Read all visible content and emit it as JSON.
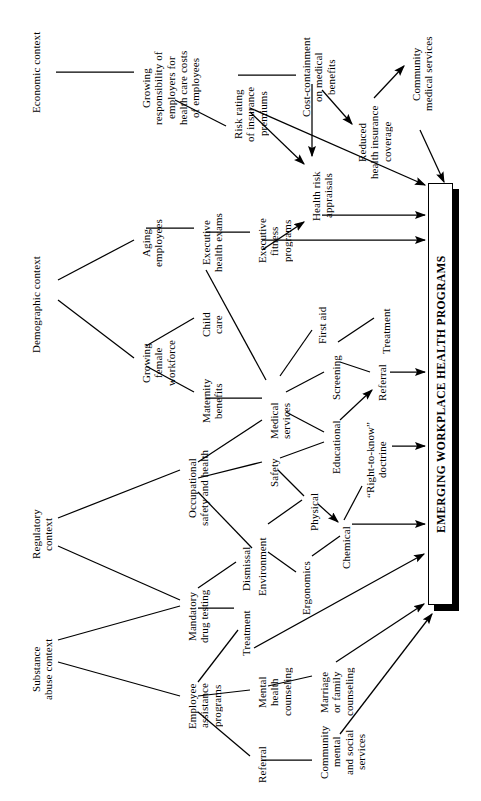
{
  "figure": {
    "type": "tree-diagram",
    "orientation": "rotated-90-ccw",
    "background": "#ffffff",
    "line_color": "#000000",
    "text_color": "#000000"
  },
  "title_box": {
    "label": "EMERGING WORKPLACE HEALTH PROGRAMS",
    "x": 428,
    "y": 183,
    "w": 25,
    "h": 422,
    "shadow_offset": 6
  },
  "nodes": [
    {
      "id": "economic-context",
      "label": "Economic context",
      "x": 30,
      "y": 18,
      "len": 108,
      "size": 11
    },
    {
      "id": "growing-responsibility",
      "label": "Growing\nresponsibility of\nemployers for\nhealth care costs\nof employees",
      "x": 140,
      "y": 36,
      "len": 104,
      "size": 11
    },
    {
      "id": "risk-rating",
      "label": "Risk rating\nof insurance\npremiums",
      "x": 232,
      "y": 78,
      "len": 72,
      "size": 11
    },
    {
      "id": "cost-containment",
      "label": "Cost-containment\non medical\nbenefits",
      "x": 300,
      "y": 26,
      "len": 102,
      "size": 11
    },
    {
      "id": "reduced-coverage",
      "label": "Reduced\nhealth insurance\ncoverage",
      "x": 356,
      "y": 94,
      "len": 96,
      "size": 11
    },
    {
      "id": "community-medical-services",
      "label": "Community\nmedical services",
      "x": 410,
      "y": 22,
      "len": 104,
      "size": 11
    },
    {
      "id": "health-risk-appraisals",
      "label": "Health risk\nappraisals",
      "x": 310,
      "y": 162,
      "len": 68,
      "size": 11
    },
    {
      "id": "demographic-context",
      "label": "Demographic context",
      "x": 30,
      "y": 242,
      "len": 126,
      "size": 11
    },
    {
      "id": "aging-employees",
      "label": "Aging\nemployees",
      "x": 140,
      "y": 210,
      "len": 66,
      "size": 11
    },
    {
      "id": "executive-health-exams",
      "label": "Executive\nhealth exams",
      "x": 200,
      "y": 202,
      "len": 82,
      "size": 11
    },
    {
      "id": "executive-fitness",
      "label": "Executive\nfitness\nprograms",
      "x": 256,
      "y": 210,
      "len": 62,
      "size": 11
    },
    {
      "id": "growing-female-workforce",
      "label": "Growing\nfemale\nworkforce",
      "x": 140,
      "y": 330,
      "len": 66,
      "size": 11
    },
    {
      "id": "child-care",
      "label": "Child\ncare",
      "x": 200,
      "y": 306,
      "len": 38,
      "size": 11
    },
    {
      "id": "maternity-benefits",
      "label": "Maternity\nbenefits",
      "x": 200,
      "y": 370,
      "len": 62,
      "size": 11
    },
    {
      "id": "medical-services",
      "label": "Medical\nservices",
      "x": 268,
      "y": 392,
      "len": 58,
      "size": 11
    },
    {
      "id": "first-aid",
      "label": "First aid",
      "x": 316,
      "y": 298,
      "len": 54,
      "size": 11
    },
    {
      "id": "screening",
      "label": "Screening",
      "x": 330,
      "y": 348,
      "len": 60,
      "size": 11
    },
    {
      "id": "treatment-med",
      "label": "Treatment",
      "x": 380,
      "y": 300,
      "len": 62,
      "size": 11
    },
    {
      "id": "referral-med",
      "label": "Referral",
      "x": 376,
      "y": 358,
      "len": 50,
      "size": 11
    },
    {
      "id": "educational",
      "label": "Educational",
      "x": 330,
      "y": 414,
      "len": 66,
      "size": 11
    },
    {
      "id": "right-to-know",
      "label": "“Right-to-know”\ndoctrine",
      "x": 364,
      "y": 414,
      "len": 92,
      "size": 11
    },
    {
      "id": "regulatory-context",
      "label": "Regulatory\ncontext",
      "x": 30,
      "y": 500,
      "len": 68,
      "size": 11
    },
    {
      "id": "occupational-safety",
      "label": "Occupational\nsafety and health",
      "x": 186,
      "y": 440,
      "len": 96,
      "size": 11
    },
    {
      "id": "safety",
      "label": "Safety",
      "x": 268,
      "y": 452,
      "len": 42,
      "size": 11
    },
    {
      "id": "physical",
      "label": "Physical",
      "x": 308,
      "y": 486,
      "len": 52,
      "size": 11
    },
    {
      "id": "chemical",
      "label": "Chemical",
      "x": 340,
      "y": 520,
      "len": 56,
      "size": 11
    },
    {
      "id": "environment",
      "label": "Environment",
      "x": 256,
      "y": 530,
      "len": 74,
      "size": 11
    },
    {
      "id": "ergonomics",
      "label": "Ergonomics",
      "x": 300,
      "y": 554,
      "len": 68,
      "size": 11
    },
    {
      "id": "substance-abuse-context",
      "label": "Substance\nabuse context",
      "x": 30,
      "y": 626,
      "len": 86,
      "size": 11
    },
    {
      "id": "mandatory-drug-testing",
      "label": "Mandatory\ndrug testing",
      "x": 186,
      "y": 578,
      "len": 76,
      "size": 11
    },
    {
      "id": "dismissal",
      "label": "Dismissal",
      "x": 240,
      "y": 540,
      "len": 58,
      "size": 11
    },
    {
      "id": "treatment-eap",
      "label": "Treatment",
      "x": 240,
      "y": 602,
      "len": 62,
      "size": 11
    },
    {
      "id": "employee-assistance",
      "label": "Employee\nassistance\nprograms",
      "x": 186,
      "y": 672,
      "len": 68,
      "size": 11
    },
    {
      "id": "mental-health-counseling",
      "label": "Mental\nhealth\ncounseling",
      "x": 256,
      "y": 658,
      "len": 68,
      "size": 11
    },
    {
      "id": "marriage-family-counseling",
      "label": "Marriage\nor family\ncounseling",
      "x": 318,
      "y": 658,
      "len": 68,
      "size": 11
    },
    {
      "id": "referral-eap",
      "label": "Referral",
      "x": 256,
      "y": 740,
      "len": 50,
      "size": 11
    },
    {
      "id": "community-mental-social",
      "label": "Community\nmental\nand social\nservices",
      "x": 318,
      "y": 718,
      "len": 68,
      "size": 11
    }
  ],
  "edges": [
    {
      "from": "economic-context",
      "to": "growing-responsibility",
      "x1": 56,
      "y1": 72,
      "x2": 134,
      "y2": 72,
      "arrow": false
    },
    {
      "from": "growing-responsibility",
      "to": "risk-rating",
      "x1": 175,
      "y1": 100,
      "x2": 226,
      "y2": 126,
      "arrow": false
    },
    {
      "from": "risk-rating",
      "to": "cost-containment",
      "x1": 238,
      "y1": 75,
      "x2": 296,
      "y2": 75,
      "arrow": false
    },
    {
      "from": "cost-containment",
      "to": "health-risk-appraisals",
      "x1": 312,
      "y1": 84,
      "x2": 312,
      "y2": 156,
      "arrow": true
    },
    {
      "from": "cost-containment",
      "to": "reduced-coverage",
      "x1": 322,
      "y1": 90,
      "x2": 352,
      "y2": 124,
      "arrow": true
    },
    {
      "from": "risk-rating",
      "to": "health-risk-appraisals",
      "x1": 250,
      "y1": 112,
      "x2": 304,
      "y2": 164,
      "arrow": true
    },
    {
      "from": "reduced-coverage",
      "to": "community-medical-services",
      "x1": 374,
      "y1": 98,
      "x2": 404,
      "y2": 66,
      "arrow": true
    },
    {
      "from": "community-medical-services",
      "to": "title-box",
      "x1": 420,
      "y1": 130,
      "x2": 444,
      "y2": 182,
      "arrow": true
    },
    {
      "from": "risk-rating",
      "to": "title-box",
      "x1": 250,
      "y1": 108,
      "x2": 425,
      "y2": 185,
      "arrow": true
    },
    {
      "from": "health-risk-appraisals",
      "to": "title-box",
      "x1": 322,
      "y1": 215,
      "x2": 425,
      "y2": 215,
      "arrow": true
    },
    {
      "from": "demographic-context",
      "to": "aging-employees",
      "x1": 58,
      "y1": 280,
      "x2": 134,
      "y2": 240,
      "arrow": false
    },
    {
      "from": "demographic-context",
      "to": "growing-female-workforce",
      "x1": 58,
      "y1": 300,
      "x2": 134,
      "y2": 358,
      "arrow": false
    },
    {
      "from": "aging-employees",
      "to": "executive-health-exams",
      "x1": 146,
      "y1": 228,
      "x2": 194,
      "y2": 228,
      "arrow": false
    },
    {
      "from": "executive-health-exams",
      "to": "executive-fitness",
      "x1": 206,
      "y1": 232,
      "x2": 250,
      "y2": 232,
      "arrow": false
    },
    {
      "from": "executive-fitness",
      "to": "health-risk-appraisals",
      "x1": 262,
      "y1": 250,
      "x2": 304,
      "y2": 222,
      "arrow": true
    },
    {
      "from": "executive-fitness",
      "to": "title-box",
      "x1": 262,
      "y1": 240,
      "x2": 425,
      "y2": 240,
      "arrow": true
    },
    {
      "from": "growing-female-workforce",
      "to": "child-care",
      "x1": 146,
      "y1": 346,
      "x2": 194,
      "y2": 318,
      "arrow": false
    },
    {
      "from": "growing-female-workforce",
      "to": "maternity-benefits",
      "x1": 146,
      "y1": 366,
      "x2": 194,
      "y2": 392,
      "arrow": false
    },
    {
      "from": "maternity-benefits",
      "to": "medical-services",
      "x1": 206,
      "y1": 398,
      "x2": 262,
      "y2": 398,
      "arrow": false
    },
    {
      "from": "executive-health-exams",
      "to": "medical-services",
      "x1": 206,
      "y1": 270,
      "x2": 266,
      "y2": 380,
      "arrow": false
    },
    {
      "from": "medical-services",
      "to": "first-aid",
      "x1": 280,
      "y1": 376,
      "x2": 312,
      "y2": 330,
      "arrow": false
    },
    {
      "from": "medical-services",
      "to": "screening",
      "x1": 286,
      "y1": 392,
      "x2": 324,
      "y2": 372,
      "arrow": false
    },
    {
      "from": "screening",
      "to": "treatment-med",
      "x1": 338,
      "y1": 342,
      "x2": 374,
      "y2": 318,
      "arrow": false
    },
    {
      "from": "screening",
      "to": "referral-med",
      "x1": 340,
      "y1": 362,
      "x2": 370,
      "y2": 372,
      "arrow": false
    },
    {
      "from": "medical-services",
      "to": "educational",
      "x1": 286,
      "y1": 412,
      "x2": 324,
      "y2": 432,
      "arrow": false
    },
    {
      "from": "educational",
      "to": "referral-med",
      "x1": 340,
      "y1": 420,
      "x2": 372,
      "y2": 390,
      "arrow": true
    },
    {
      "from": "referral-med",
      "to": "title-box",
      "x1": 390,
      "y1": 372,
      "x2": 425,
      "y2": 372,
      "arrow": true
    },
    {
      "from": "right-to-know",
      "to": "title-box",
      "x1": 392,
      "y1": 446,
      "x2": 425,
      "y2": 446,
      "arrow": true
    },
    {
      "from": "regulatory-context",
      "to": "occupational-safety",
      "x1": 58,
      "y1": 518,
      "x2": 180,
      "y2": 470,
      "arrow": false
    },
    {
      "from": "regulatory-context",
      "to": "mandatory-drug-testing",
      "x1": 58,
      "y1": 546,
      "x2": 180,
      "y2": 600,
      "arrow": false
    },
    {
      "from": "substance-abuse-context",
      "to": "mandatory-drug-testing",
      "x1": 58,
      "y1": 640,
      "x2": 180,
      "y2": 606,
      "arrow": false
    },
    {
      "from": "substance-abuse-context",
      "to": "employee-assistance",
      "x1": 58,
      "y1": 662,
      "x2": 180,
      "y2": 696,
      "arrow": false
    },
    {
      "from": "occupational-safety",
      "to": "medical-services",
      "x1": 198,
      "y1": 462,
      "x2": 262,
      "y2": 420,
      "arrow": false
    },
    {
      "from": "occupational-safety",
      "to": "safety",
      "x1": 198,
      "y1": 478,
      "x2": 262,
      "y2": 462,
      "arrow": false
    },
    {
      "from": "occupational-safety",
      "to": "environment",
      "x1": 198,
      "y1": 492,
      "x2": 252,
      "y2": 548,
      "arrow": false
    },
    {
      "from": "safety",
      "to": "physical",
      "x1": 278,
      "y1": 470,
      "x2": 304,
      "y2": 496,
      "arrow": false
    },
    {
      "from": "safety",
      "to": "educational",
      "x1": 280,
      "y1": 458,
      "x2": 324,
      "y2": 442,
      "arrow": false
    },
    {
      "from": "physical",
      "to": "chemical",
      "x1": 318,
      "y1": 504,
      "x2": 338,
      "y2": 522,
      "arrow": true
    },
    {
      "from": "environment",
      "to": "physical",
      "x1": 268,
      "y1": 524,
      "x2": 302,
      "y2": 500,
      "arrow": false
    },
    {
      "from": "environment",
      "to": "ergonomics",
      "x1": 268,
      "y1": 552,
      "x2": 296,
      "y2": 572,
      "arrow": false
    },
    {
      "from": "ergonomics",
      "to": "chemical",
      "x1": 312,
      "y1": 556,
      "x2": 340,
      "y2": 536,
      "arrow": false
    },
    {
      "from": "right-to-know",
      "to": "chemical",
      "x1": 362,
      "y1": 486,
      "x2": 344,
      "y2": 520,
      "arrow": false
    },
    {
      "from": "chemical",
      "to": "title-box",
      "x1": 352,
      "y1": 524,
      "x2": 425,
      "y2": 524,
      "arrow": true
    },
    {
      "from": "mandatory-drug-testing",
      "to": "dismissal",
      "x1": 198,
      "y1": 588,
      "x2": 236,
      "y2": 562,
      "arrow": false
    },
    {
      "from": "mandatory-drug-testing",
      "to": "treatment-eap",
      "x1": 198,
      "y1": 608,
      "x2": 234,
      "y2": 608,
      "arrow": false
    },
    {
      "from": "employee-assistance",
      "to": "treatment-eap",
      "x1": 198,
      "y1": 682,
      "x2": 238,
      "y2": 630,
      "arrow": false
    },
    {
      "from": "employee-assistance",
      "to": "mental-health-counseling",
      "x1": 198,
      "y1": 696,
      "x2": 250,
      "y2": 690,
      "arrow": false
    },
    {
      "from": "employee-assistance",
      "to": "referral-eap",
      "x1": 198,
      "y1": 712,
      "x2": 250,
      "y2": 756,
      "arrow": false
    },
    {
      "from": "treatment-eap",
      "to": "title-box",
      "x1": 254,
      "y1": 648,
      "x2": 424,
      "y2": 554,
      "arrow": true
    },
    {
      "from": "mental-health-counseling",
      "to": "marriage-family-counseling",
      "x1": 268,
      "y1": 686,
      "x2": 312,
      "y2": 676,
      "arrow": false
    },
    {
      "from": "marriage-family-counseling",
      "to": "title-box",
      "x1": 336,
      "y1": 662,
      "x2": 424,
      "y2": 604,
      "arrow": true
    },
    {
      "from": "referral-eap",
      "to": "community-mental-social",
      "x1": 262,
      "y1": 760,
      "x2": 312,
      "y2": 760,
      "arrow": false
    },
    {
      "from": "community-mental-social",
      "to": "title-box",
      "x1": 340,
      "y1": 734,
      "x2": 432,
      "y2": 614,
      "arrow": true
    }
  ]
}
